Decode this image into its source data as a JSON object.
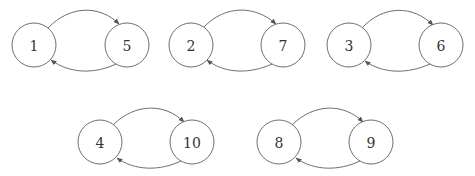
{
  "diagram": {
    "type": "directed-graph",
    "colors": {
      "stroke": "#6e6e6e",
      "text": "#333333",
      "background": "#ffffff"
    },
    "nodes": [
      {
        "id": "1",
        "label": "1",
        "x": 34,
        "y": 45
      },
      {
        "id": "5",
        "label": "5",
        "x": 127,
        "y": 45
      },
      {
        "id": "2",
        "label": "2",
        "x": 191,
        "y": 45
      },
      {
        "id": "7",
        "label": "7",
        "x": 283,
        "y": 45
      },
      {
        "id": "3",
        "label": "3",
        "x": 349,
        "y": 45
      },
      {
        "id": "6",
        "label": "6",
        "x": 441,
        "y": 45
      },
      {
        "id": "4",
        "label": "4",
        "x": 100,
        "y": 142
      },
      {
        "id": "10",
        "label": "10",
        "x": 192,
        "y": 142
      },
      {
        "id": "8",
        "label": "8",
        "x": 279,
        "y": 142
      },
      {
        "id": "9",
        "label": "9",
        "x": 371,
        "y": 142
      }
    ],
    "edges": [
      {
        "from": "1",
        "to": "5"
      },
      {
        "from": "5",
        "to": "1"
      },
      {
        "from": "2",
        "to": "7"
      },
      {
        "from": "7",
        "to": "2"
      },
      {
        "from": "3",
        "to": "6"
      },
      {
        "from": "6",
        "to": "3"
      },
      {
        "from": "4",
        "to": "10"
      },
      {
        "from": "10",
        "to": "4"
      },
      {
        "from": "8",
        "to": "9"
      },
      {
        "from": "9",
        "to": "8"
      }
    ]
  }
}
